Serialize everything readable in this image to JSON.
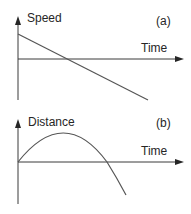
{
  "panels": [
    {
      "id": "a",
      "tag": "(a)",
      "y_label": "Speed",
      "x_label": "Time",
      "curve": "linear-decreasing"
    },
    {
      "id": "b",
      "tag": "(b)",
      "y_label": "Distance",
      "x_label": "Time",
      "curve": "parabola-concave-down"
    }
  ],
  "colors": {
    "axis": "#3a3a3a",
    "curve": "#555555",
    "text": "#262626"
  }
}
